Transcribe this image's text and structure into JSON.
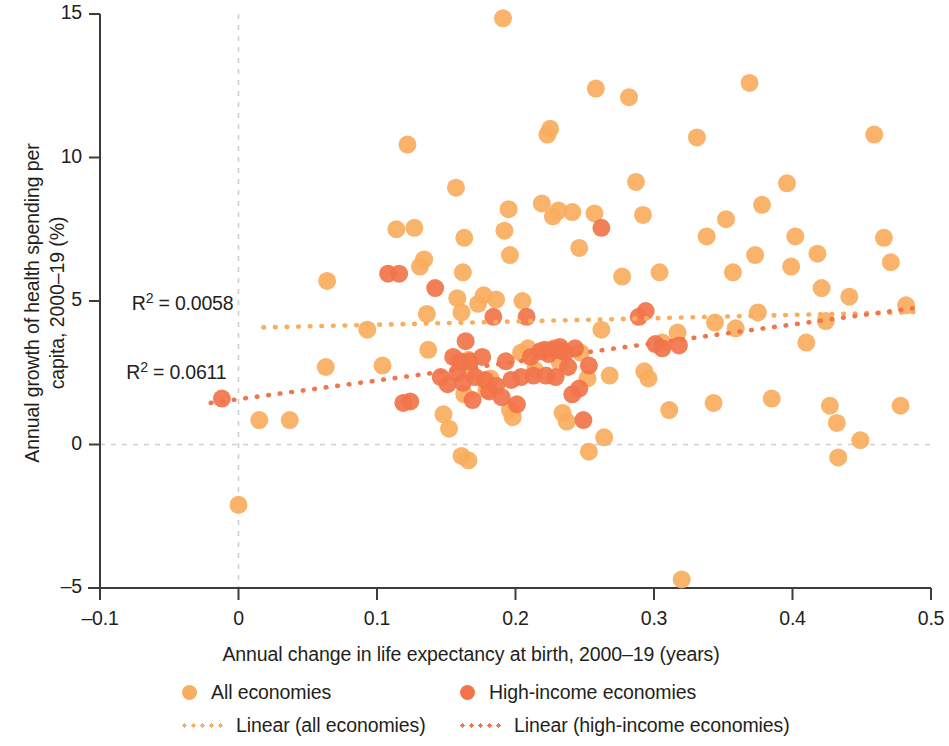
{
  "chart_data": {
    "type": "scatter",
    "title": "",
    "xlabel": "Annual change in life expectancy at birth, 2000–19 (years)",
    "ylabel": "Annual growth of health spending per capita, 2000–19 (%)",
    "ylabel_line1": "Annual growth of health spending per",
    "ylabel_line2": "capita, 2000–19 (%)",
    "xlim": [
      -0.1,
      0.5
    ],
    "ylim": [
      -5,
      15
    ],
    "xticks": [
      -0.1,
      0,
      0.1,
      0.2,
      0.3,
      0.4,
      0.5
    ],
    "xtick_labels": [
      "–0.1",
      "0",
      "0.1",
      "0.2",
      "0.3",
      "0.4",
      "0.5"
    ],
    "yticks": [
      -5,
      0,
      5,
      10,
      15
    ],
    "ytick_labels": [
      "–5",
      "0",
      "5",
      "10",
      "15"
    ],
    "grid": "dashed gridlines at x=0 and y=0 only",
    "legend_position": "bottom-center",
    "colors": {
      "all_economies": "#f9ad5e",
      "high_income": "#f2744b",
      "axis": "#3c3c3b",
      "gridline": "#cfcfcf",
      "text": "#231f20"
    },
    "annotations": [
      {
        "text": "R² = 0.0058",
        "x": -0.077,
        "y": 4.85,
        "series": "Linear (all economies)"
      },
      {
        "text": "R² = 0.0611",
        "x": -0.081,
        "y": 2.45,
        "series": "Linear (high-income economies)"
      }
    ],
    "trendlines": [
      {
        "name": "Linear (all economies)",
        "color": "#f9ad5e",
        "style": "dotted",
        "r2": 0.0058,
        "x_start": 0.018,
        "y_start": 4.08,
        "x_end": 0.492,
        "y_end": 4.62
      },
      {
        "name": "Linear (high-income economies)",
        "color": "#f2744b",
        "style": "dotted",
        "r2": 0.0611,
        "x_start": -0.02,
        "y_start": 1.45,
        "x_end": 0.492,
        "y_end": 4.78
      }
    ],
    "series": [
      {
        "name": "All economies",
        "color": "#f9ad5e",
        "marker": "circle",
        "points": [
          [
            0.0,
            -2.1
          ],
          [
            0.015,
            0.85
          ],
          [
            0.037,
            0.85
          ],
          [
            0.064,
            5.7
          ],
          [
            0.063,
            2.7
          ],
          [
            0.093,
            4.0
          ],
          [
            0.104,
            2.75
          ],
          [
            0.122,
            10.45
          ],
          [
            0.114,
            7.5
          ],
          [
            0.127,
            7.55
          ],
          [
            0.134,
            6.45
          ],
          [
            0.131,
            6.2
          ],
          [
            0.136,
            4.55
          ],
          [
            0.137,
            3.3
          ],
          [
            0.148,
            1.05
          ],
          [
            0.152,
            0.55
          ],
          [
            0.157,
            8.95
          ],
          [
            0.163,
            7.2
          ],
          [
            0.162,
            6.0
          ],
          [
            0.158,
            5.1
          ],
          [
            0.161,
            4.6
          ],
          [
            0.166,
            2.95
          ],
          [
            0.167,
            2.55
          ],
          [
            0.163,
            1.75
          ],
          [
            0.161,
            -0.4
          ],
          [
            0.166,
            -0.55
          ],
          [
            0.173,
            4.9
          ],
          [
            0.177,
            5.2
          ],
          [
            0.179,
            1.9
          ],
          [
            0.182,
            2.3
          ],
          [
            0.186,
            5.05
          ],
          [
            0.191,
            14.85
          ],
          [
            0.192,
            7.45
          ],
          [
            0.196,
            6.6
          ],
          [
            0.195,
            8.2
          ],
          [
            0.196,
            1.2
          ],
          [
            0.198,
            0.95
          ],
          [
            0.205,
            5.0
          ],
          [
            0.204,
            3.2
          ],
          [
            0.209,
            3.35
          ],
          [
            0.214,
            2.6
          ],
          [
            0.219,
            8.4
          ],
          [
            0.223,
            10.8
          ],
          [
            0.225,
            11.0
          ],
          [
            0.227,
            7.95
          ],
          [
            0.231,
            8.15
          ],
          [
            0.228,
            3.35
          ],
          [
            0.232,
            2.85
          ],
          [
            0.234,
            1.1
          ],
          [
            0.237,
            0.8
          ],
          [
            0.241,
            8.1
          ],
          [
            0.246,
            6.85
          ],
          [
            0.247,
            3.2
          ],
          [
            0.252,
            2.3
          ],
          [
            0.258,
            12.4
          ],
          [
            0.257,
            8.05
          ],
          [
            0.253,
            -0.25
          ],
          [
            0.262,
            4.0
          ],
          [
            0.264,
            0.25
          ],
          [
            0.268,
            2.4
          ],
          [
            0.277,
            5.85
          ],
          [
            0.282,
            12.1
          ],
          [
            0.287,
            9.15
          ],
          [
            0.292,
            8.0
          ],
          [
            0.293,
            2.55
          ],
          [
            0.296,
            2.3
          ],
          [
            0.304,
            6.0
          ],
          [
            0.306,
            3.55
          ],
          [
            0.311,
            1.2
          ],
          [
            0.317,
            3.9
          ],
          [
            0.32,
            -4.7
          ],
          [
            0.331,
            10.7
          ],
          [
            0.338,
            7.25
          ],
          [
            0.344,
            4.25
          ],
          [
            0.343,
            1.45
          ],
          [
            0.352,
            7.85
          ],
          [
            0.357,
            6.0
          ],
          [
            0.359,
            4.05
          ],
          [
            0.369,
            12.6
          ],
          [
            0.373,
            6.6
          ],
          [
            0.375,
            4.6
          ],
          [
            0.378,
            8.35
          ],
          [
            0.385,
            1.6
          ],
          [
            0.396,
            9.1
          ],
          [
            0.399,
            6.2
          ],
          [
            0.402,
            7.25
          ],
          [
            0.41,
            3.55
          ],
          [
            0.418,
            6.65
          ],
          [
            0.421,
            5.45
          ],
          [
            0.424,
            4.3
          ],
          [
            0.427,
            1.35
          ],
          [
            0.432,
            0.75
          ],
          [
            0.433,
            -0.45
          ],
          [
            0.441,
            5.15
          ],
          [
            0.449,
            0.15
          ],
          [
            0.459,
            10.8
          ],
          [
            0.466,
            7.2
          ],
          [
            0.471,
            6.35
          ],
          [
            0.478,
            1.35
          ],
          [
            0.482,
            4.85
          ]
        ]
      },
      {
        "name": "High-income economies",
        "color": "#f2744b",
        "marker": "circle",
        "points": [
          [
            -0.012,
            1.6
          ],
          [
            0.108,
            5.95
          ],
          [
            0.116,
            5.95
          ],
          [
            0.119,
            1.45
          ],
          [
            0.124,
            1.5
          ],
          [
            0.142,
            5.45
          ],
          [
            0.146,
            2.35
          ],
          [
            0.151,
            2.1
          ],
          [
            0.155,
            3.05
          ],
          [
            0.158,
            2.5
          ],
          [
            0.16,
            2.9
          ],
          [
            0.162,
            2.15
          ],
          [
            0.164,
            3.6
          ],
          [
            0.167,
            2.9
          ],
          [
            0.169,
            1.55
          ],
          [
            0.171,
            2.35
          ],
          [
            0.176,
            3.05
          ],
          [
            0.178,
            2.25
          ],
          [
            0.181,
            1.85
          ],
          [
            0.184,
            4.45
          ],
          [
            0.186,
            2.05
          ],
          [
            0.19,
            1.65
          ],
          [
            0.193,
            2.9
          ],
          [
            0.197,
            2.25
          ],
          [
            0.201,
            1.4
          ],
          [
            0.204,
            2.35
          ],
          [
            0.208,
            4.45
          ],
          [
            0.211,
            3.05
          ],
          [
            0.213,
            2.4
          ],
          [
            0.218,
            3.25
          ],
          [
            0.221,
            3.3
          ],
          [
            0.222,
            2.4
          ],
          [
            0.224,
            3.15
          ],
          [
            0.227,
            3.3
          ],
          [
            0.229,
            2.35
          ],
          [
            0.232,
            3.4
          ],
          [
            0.234,
            3.25
          ],
          [
            0.236,
            3.2
          ],
          [
            0.238,
            2.7
          ],
          [
            0.241,
            1.75
          ],
          [
            0.243,
            3.35
          ],
          [
            0.246,
            1.95
          ],
          [
            0.249,
            0.85
          ],
          [
            0.253,
            2.75
          ],
          [
            0.262,
            7.55
          ],
          [
            0.289,
            4.45
          ],
          [
            0.294,
            4.65
          ],
          [
            0.301,
            3.5
          ],
          [
            0.306,
            3.35
          ],
          [
            0.318,
            3.45
          ]
        ]
      }
    ]
  }
}
